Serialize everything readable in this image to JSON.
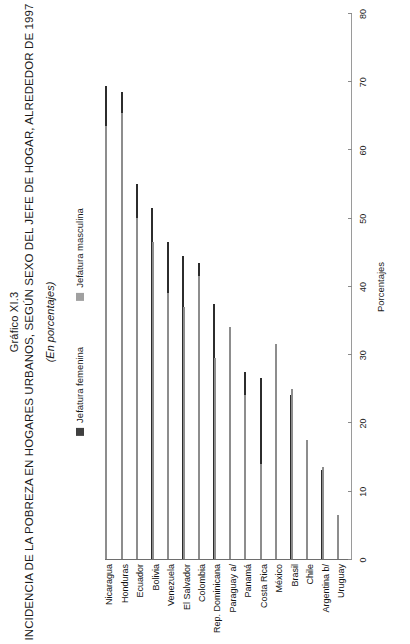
{
  "figure": {
    "number": "Gráfico XI.3",
    "title": "INCIDENCIA DE LA POBREZA EN HOGARES URBANOS, SEGÚN SEXO DEL  JEFE DE HOGAR, ALREDEDOR DE 1997",
    "subtitle": "(En porcentajes)"
  },
  "legend": {
    "items": [
      {
        "label": "Jefatura femenina",
        "color": "#404040",
        "key": "fem"
      },
      {
        "label": "Jefatura masculina",
        "color": "#a6a6a6",
        "key": "mas"
      }
    ]
  },
  "axis": {
    "title": "Porcentajes",
    "ticks": [
      "0",
      "10",
      "20",
      "30",
      "40",
      "50",
      "60",
      "70",
      "80"
    ]
  },
  "chart_data": {
    "type": "bar",
    "title": "INCIDENCIA DE LA POBREZA EN HOGARES URBANOS, SEGÚN SEXO DEL  JEFE DE HOGAR, ALREDEDOR DE 1997",
    "subtitle": "(En porcentajes)",
    "xlabel": "",
    "ylabel": "Porcentajes",
    "ylim": [
      0,
      80
    ],
    "grid": false,
    "legend_position": "top",
    "orientation": "horizontal",
    "categories": [
      "Nicaragua",
      "Honduras",
      "Ecuador",
      "Bolivia",
      "Venezuela",
      "El Salvador",
      "Colombia",
      "Rep. Dominicana",
      "Paraguay a/",
      "Panamá",
      "Costa Rica",
      "México",
      "Brasil",
      "Chile",
      "Argentina b/",
      "Uruguay"
    ],
    "series": [
      {
        "name": "Jefatura femenina",
        "color": "#404040",
        "values": [
          69.5,
          68.5,
          55.0,
          51.5,
          46.5,
          44.5,
          43.5,
          37.5,
          32.0,
          27.5,
          26.5,
          26.0,
          24.0,
          17.0,
          13.0,
          4.5
        ]
      },
      {
        "name": "Jefatura masculina",
        "color": "#a6a6a6",
        "values": [
          63.5,
          65.5,
          50.0,
          46.5,
          39.0,
          37.0,
          41.5,
          29.5,
          34.0,
          24.0,
          14.0,
          31.5,
          25.0,
          17.5,
          13.5,
          6.5
        ]
      }
    ]
  }
}
